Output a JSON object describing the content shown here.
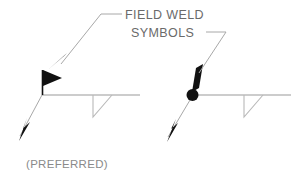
{
  "figure": {
    "title_lines": [
      "FIELD WELD",
      "SYMBOLS"
    ],
    "caption": "(PREFERRED)",
    "background_color": "#ffffff",
    "ink_color": "#111111",
    "line_color": "#a8a8a8",
    "text_color": "#6a6a6a"
  },
  "annotations": {
    "line1": "FIELD WELD",
    "line2": "SYMBOLS",
    "preferred_caption": "(PREFERRED)"
  },
  "symbols": [
    {
      "id": "left-symbol",
      "name": "field-weld-flag-symbol",
      "flag_style": "solid-triangle-flag",
      "joint_marker": "none",
      "weld_type": "fillet",
      "caption": "(PREFERRED)"
    },
    {
      "id": "right-symbol",
      "name": "field-weld-dot-flag-symbol",
      "flag_style": "solid-triangle-flag",
      "joint_marker": "filled-circle",
      "weld_type": "fillet",
      "caption": ""
    }
  ]
}
